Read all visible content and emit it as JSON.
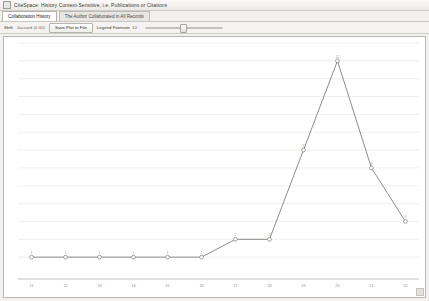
{
  "window": {
    "title": "CiteSpace: History Context-Sensitive, i.e. Publications or Citations",
    "icon": "window-icon"
  },
  "tabs": [
    {
      "label": "Collaboration History",
      "active": true
    },
    {
      "label": "The Author Collaborated in All Records",
      "active": false
    }
  ],
  "toolbar": {
    "shift_label": "Shift",
    "shift_value": "Jaccard (0.00)",
    "save_button": "Save Plot to File",
    "legend_footnote_label": "Legend Footnote",
    "legend_footnote_value": "10",
    "slider_name": "zoom-slider",
    "slider_value": 45
  },
  "chart_data": {
    "type": "line",
    "title": "",
    "xlabel": "",
    "ylabel": "",
    "categories": [
      "11",
      "12",
      "13",
      "14",
      "15",
      "16",
      "17",
      "18",
      "19",
      "20",
      "21",
      "22"
    ],
    "x": [
      11,
      12,
      13,
      14,
      15,
      16,
      17,
      18,
      19,
      20,
      21,
      22
    ],
    "values": [
      1,
      1,
      1,
      1,
      1,
      1,
      2,
      2,
      7,
      12,
      6,
      3
    ],
    "point_labels": [
      "1",
      "1",
      "1",
      "1",
      "1",
      "1",
      "2",
      "2",
      "7",
      "12",
      "6",
      "3"
    ],
    "xlim": [
      10.6,
      22.4
    ],
    "ylim": [
      0,
      13
    ],
    "grid": true,
    "gridlines_y": [
      1,
      2,
      3,
      4,
      5,
      6,
      7,
      8,
      9,
      10,
      11,
      12,
      13
    ],
    "legend": [],
    "legend_position": "none",
    "series": [
      {
        "name": "Collaboration count",
        "values": [
          1,
          1,
          1,
          1,
          1,
          1,
          2,
          2,
          7,
          12,
          6,
          3
        ]
      }
    ],
    "marker": "open-circle",
    "line_color": "#8e8c88",
    "marker_fill": "#ffffff"
  }
}
